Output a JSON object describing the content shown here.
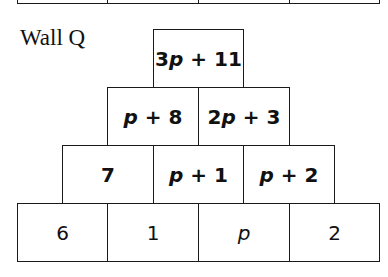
{
  "wall_label": "Wall Q",
  "previous_wall_bottom": {
    "cells": [
      "",
      "",
      "",
      ""
    ]
  },
  "rows": [
    {
      "level": 4,
      "style": "bold",
      "cells": [
        {
          "html": "3<i>p</i> + 11",
          "text": "3p + 11"
        }
      ]
    },
    {
      "level": 3,
      "style": "bold",
      "cells": [
        {
          "html": "<i>p</i> + 8",
          "text": "p + 8"
        },
        {
          "html": "2<i>p</i> + 3",
          "text": "2p + 3"
        }
      ]
    },
    {
      "level": 2,
      "style": "bold",
      "cells": [
        {
          "html": "7",
          "text": "7"
        },
        {
          "html": "<i>p</i> + 1",
          "text": "p + 1"
        },
        {
          "html": "<i>p</i> + 2",
          "text": "p + 2"
        }
      ]
    },
    {
      "level": 1,
      "style": "regular",
      "cells": [
        {
          "html": "6",
          "text": "6"
        },
        {
          "html": "1",
          "text": "1"
        },
        {
          "html": "<i>p</i>",
          "text": "p"
        },
        {
          "html": "2",
          "text": "2"
        }
      ]
    }
  ]
}
